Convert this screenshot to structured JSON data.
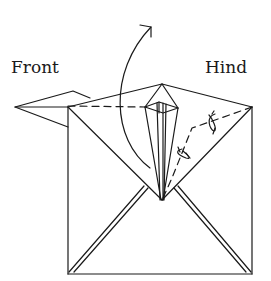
{
  "diagram": {
    "type": "origami-fold-step",
    "labels": {
      "front": "Front",
      "hind": "Hind"
    },
    "colors": {
      "line": "#1a1a1a",
      "background": "#ffffff"
    },
    "symbols": [
      "curved-fold-arrow",
      "rotate-arrow",
      "rotate-arrow",
      "dashed-fold-line"
    ]
  }
}
